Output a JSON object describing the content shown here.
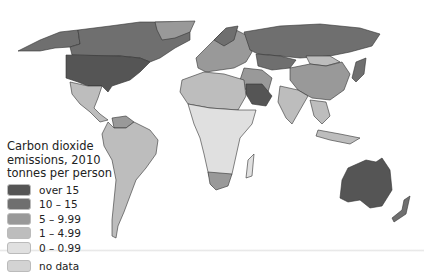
{
  "legend": {
    "title_line1": "Carbon dioxide",
    "title_line2": "emissions, 2010",
    "title_line3": "tonnes per person",
    "items": [
      {
        "label": "over 15",
        "color": "#555555"
      },
      {
        "label": "10 – 15",
        "color": "#6f6f6f"
      },
      {
        "label": "5 – 9.99",
        "color": "#999999"
      },
      {
        "label": "1 – 4.99",
        "color": "#bdbdbd"
      },
      {
        "label": "0 – 0.99",
        "color": "#e0e0e0"
      },
      {
        "label": "no data",
        "color": "#d3d3d3"
      }
    ]
  },
  "colors": {
    "over15": "#555555",
    "c10_15": "#6f6f6f",
    "c5_10": "#999999",
    "c1_5": "#bdbdbd",
    "c0_1": "#e0e0e0",
    "border": "#333333"
  }
}
